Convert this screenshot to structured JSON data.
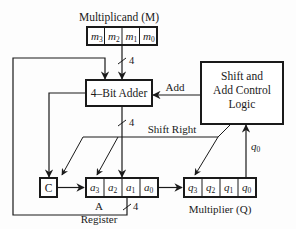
{
  "diagram": {
    "multiplicand": {
      "title": "Multiplicand (M)",
      "bits": [
        {
          "base": "m",
          "sub": "3"
        },
        {
          "base": "m",
          "sub": "2"
        },
        {
          "base": "m",
          "sub": "1"
        },
        {
          "base": "m",
          "sub": "0"
        }
      ]
    },
    "adder": {
      "label": "4–Bit Adder"
    },
    "control": {
      "lines": [
        "Shift and",
        "Add Control",
        "Logic"
      ]
    },
    "signals": {
      "add": "Add",
      "shift_right": "Shift Right",
      "q0": {
        "base": "q",
        "sub": "0"
      },
      "bus_width_top": "4",
      "bus_width_mid": "4",
      "bus_width_bottom": "4"
    },
    "carry": {
      "label": "C"
    },
    "a_register": {
      "title_line1": "A",
      "title_line2": "Register",
      "bits": [
        {
          "base": "a",
          "sub": "3"
        },
        {
          "base": "a",
          "sub": "2"
        },
        {
          "base": "a",
          "sub": "1"
        },
        {
          "base": "a",
          "sub": "0"
        }
      ]
    },
    "q_register": {
      "title": "Multiplier (Q)",
      "bits": [
        {
          "base": "q",
          "sub": "3"
        },
        {
          "base": "q",
          "sub": "2"
        },
        {
          "base": "q",
          "sub": "1"
        },
        {
          "base": "q",
          "sub": "0"
        }
      ]
    }
  }
}
